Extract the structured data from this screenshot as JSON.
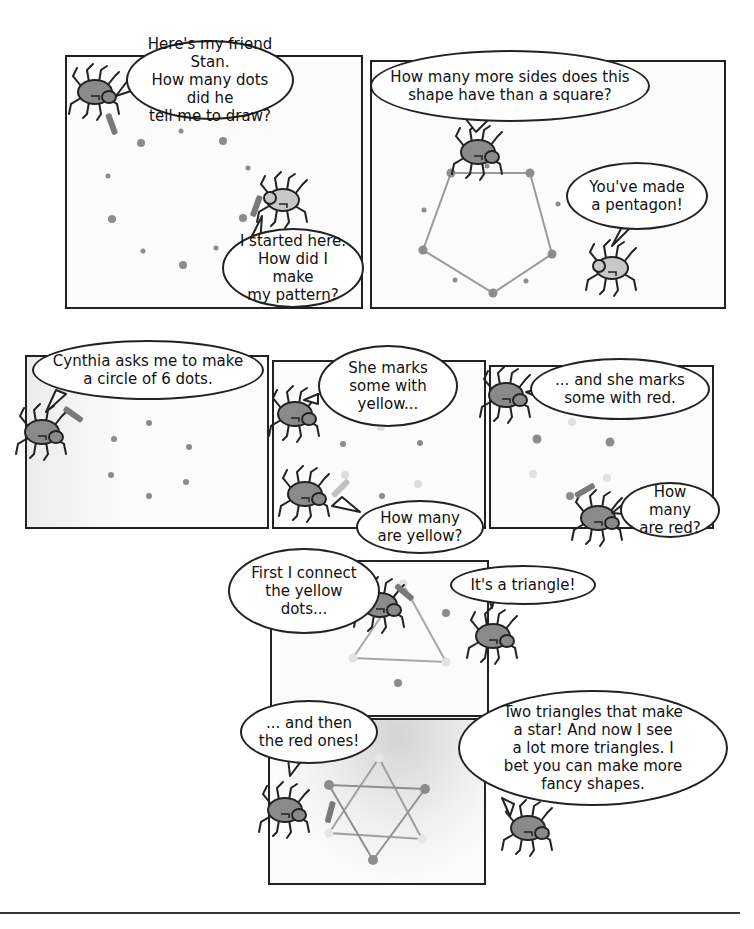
{
  "comic": {
    "panels": [
      {
        "id": 1,
        "bubbles": [
          {
            "speaker": "spider",
            "text": "Here's my friend Stan.\nHow many dots did he\ntell me to draw?"
          },
          {
            "speaker": "stan",
            "text": "I started here.\nHow did I make\nmy pattern?"
          }
        ]
      },
      {
        "id": 2,
        "bubbles": [
          {
            "speaker": "spider",
            "text": "How many more sides does this\nshape have than a square?"
          },
          {
            "speaker": "stan",
            "text": "You've made\na pentagon!"
          }
        ],
        "shape": "pentagon"
      },
      {
        "id": 3,
        "bubbles": [
          {
            "speaker": "spider",
            "text": "Cynthia asks me to make\na circle of 6 dots."
          }
        ]
      },
      {
        "id": 4,
        "bubbles": [
          {
            "speaker": "spider",
            "text": "She marks\nsome with\nyellow..."
          },
          {
            "speaker": "spider",
            "text": "How many\nare yellow?"
          }
        ]
      },
      {
        "id": 5,
        "bubbles": [
          {
            "speaker": "spider",
            "text": "... and she marks\nsome with red."
          },
          {
            "speaker": "spider",
            "text": "How many\nare red?"
          }
        ]
      },
      {
        "id": 6,
        "bubbles": [
          {
            "speaker": "spider",
            "text": "First I connect\nthe yellow\ndots..."
          },
          {
            "speaker": "spider",
            "text": "It's a triangle!"
          }
        ],
        "shape": "triangle"
      },
      {
        "id": 7,
        "bubbles": [
          {
            "speaker": "spider",
            "text": "... and then\nthe red ones!"
          },
          {
            "speaker": "spider",
            "text": "Two triangles that make\na star! And now I see\na lot more triangles. I\nbet you can make more\nfancy shapes."
          }
        ],
        "shape": "six-pointed star"
      }
    ],
    "colors": {
      "ink": "#222222",
      "spider_body": "#8a8a8a",
      "spider_light": "#c4c4c4",
      "dot": "#8c8c8c",
      "dot_light": "#dddddd",
      "line": "#9a9a9a",
      "shade": "#d8d8d8"
    }
  }
}
